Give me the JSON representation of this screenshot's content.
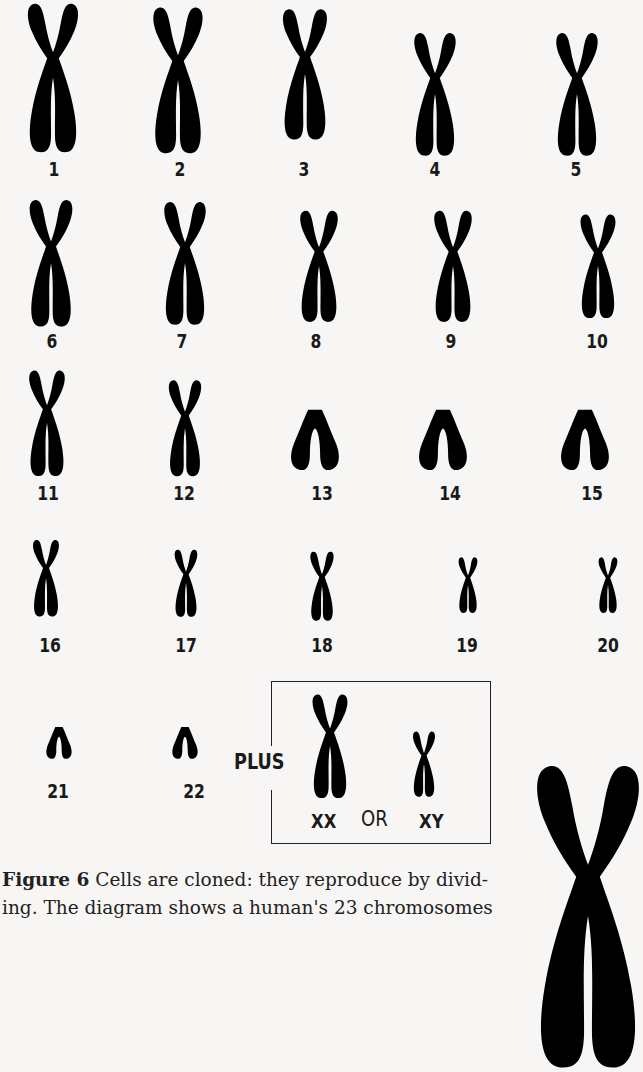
{
  "figure": {
    "number_label": "Figure 6",
    "caption_line1": " Cells are cloned: they reproduce by divid-",
    "caption_line2": "ing. The diagram shows a human's 23 chromosomes",
    "ink_color": "#5e5e5e",
    "background_color": "#f7f6f4"
  },
  "chromosomes": [
    {
      "label": "1"
    },
    {
      "label": "2"
    },
    {
      "label": "3"
    },
    {
      "label": "4"
    },
    {
      "label": "5"
    },
    {
      "label": "6"
    },
    {
      "label": "7"
    },
    {
      "label": "8"
    },
    {
      "label": "9"
    },
    {
      "label": "10"
    },
    {
      "label": "11"
    },
    {
      "label": "12"
    },
    {
      "label": "13"
    },
    {
      "label": "14"
    },
    {
      "label": "15"
    },
    {
      "label": "16"
    },
    {
      "label": "17"
    },
    {
      "label": "18"
    },
    {
      "label": "19"
    },
    {
      "label": "20"
    },
    {
      "label": "21"
    },
    {
      "label": "22"
    }
  ],
  "sex_chromosomes": {
    "prefix": "PLUS",
    "female": "XX",
    "connector": "OR",
    "male": "XY"
  }
}
